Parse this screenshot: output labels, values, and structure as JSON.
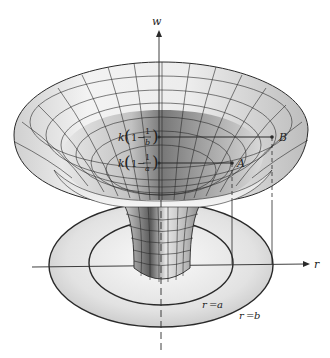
{
  "figure": {
    "type": "wormhole-embedding-surface"
  },
  "axes": {
    "vertical_label": "w",
    "horizontal_label": "r"
  },
  "points": {
    "A": {
      "label": "A",
      "height_label_prefix": "k",
      "height_label_one": "1",
      "height_label_minus": "−",
      "height_label_num": "1",
      "height_label_den": "a"
    },
    "B": {
      "label": "B",
      "height_label_prefix": "k",
      "height_label_one": "1",
      "height_label_minus": "−",
      "height_label_num": "1",
      "height_label_den": "b"
    }
  },
  "circles": {
    "inner": {
      "label": "r = a",
      "lhs": "r",
      "eq": "=",
      "rhs": "a"
    },
    "outer": {
      "label": "r = b",
      "lhs": "r",
      "eq": "=",
      "rhs": "b"
    }
  },
  "colors": {
    "line": "#2a2a2a",
    "surface_light": "#f2f2f2",
    "surface_dark": "#6e6e6e",
    "disk_light": "#f4f4f4",
    "disk_dark": "#c8c8c8"
  }
}
